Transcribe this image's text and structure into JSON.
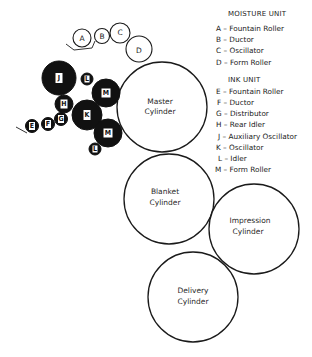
{
  "legend": {
    "moisture": {
      "title": "MOISTURE UNIT",
      "items": [
        {
          "key": "A",
          "label": "A – Fountain Roller"
        },
        {
          "key": "B",
          "label": "B – Ductor"
        },
        {
          "key": "C",
          "label": "C – Oscillator"
        },
        {
          "key": "D",
          "label": "D – Form Roller"
        }
      ]
    },
    "ink": {
      "title": "INK UNIT",
      "items": [
        {
          "key": "E",
          "label": "E – Fountain Roller"
        },
        {
          "key": "F",
          "label": "F – Ductor"
        },
        {
          "key": "G",
          "label": "G – Distributor"
        },
        {
          "key": "H",
          "label": "H – Rear Idler"
        },
        {
          "key": "J",
          "label": "J – Auxiliary Oscillator"
        },
        {
          "key": "K",
          "label": "K – Oscillator"
        },
        {
          "key": "L",
          "label": "L – Idler"
        },
        {
          "key": "M",
          "label": "M – Form Roller"
        }
      ]
    }
  },
  "cylinders": {
    "master": {
      "line1": "Master",
      "line2": "Cylinder"
    },
    "blanket": {
      "line1": "Blanket",
      "line2": "Cylinder"
    },
    "impression": {
      "line1": "Impression",
      "line2": "Cylinder"
    },
    "delivery": {
      "line1": "Delivery",
      "line2": "Cylinder"
    }
  },
  "rollers": {
    "moisture": {
      "a": "A",
      "b": "B",
      "c": "C",
      "d": "D"
    },
    "ink": {
      "e": "E",
      "f": "F",
      "g": "G",
      "h": "H",
      "j": "J",
      "k": "K",
      "l_top": "L",
      "l_bottom": "L",
      "m_top": "M",
      "m_bottom": "M"
    }
  },
  "colors": {
    "ink_roller": "#111111",
    "line": "#1a1a1a",
    "background": "#ffffff"
  }
}
